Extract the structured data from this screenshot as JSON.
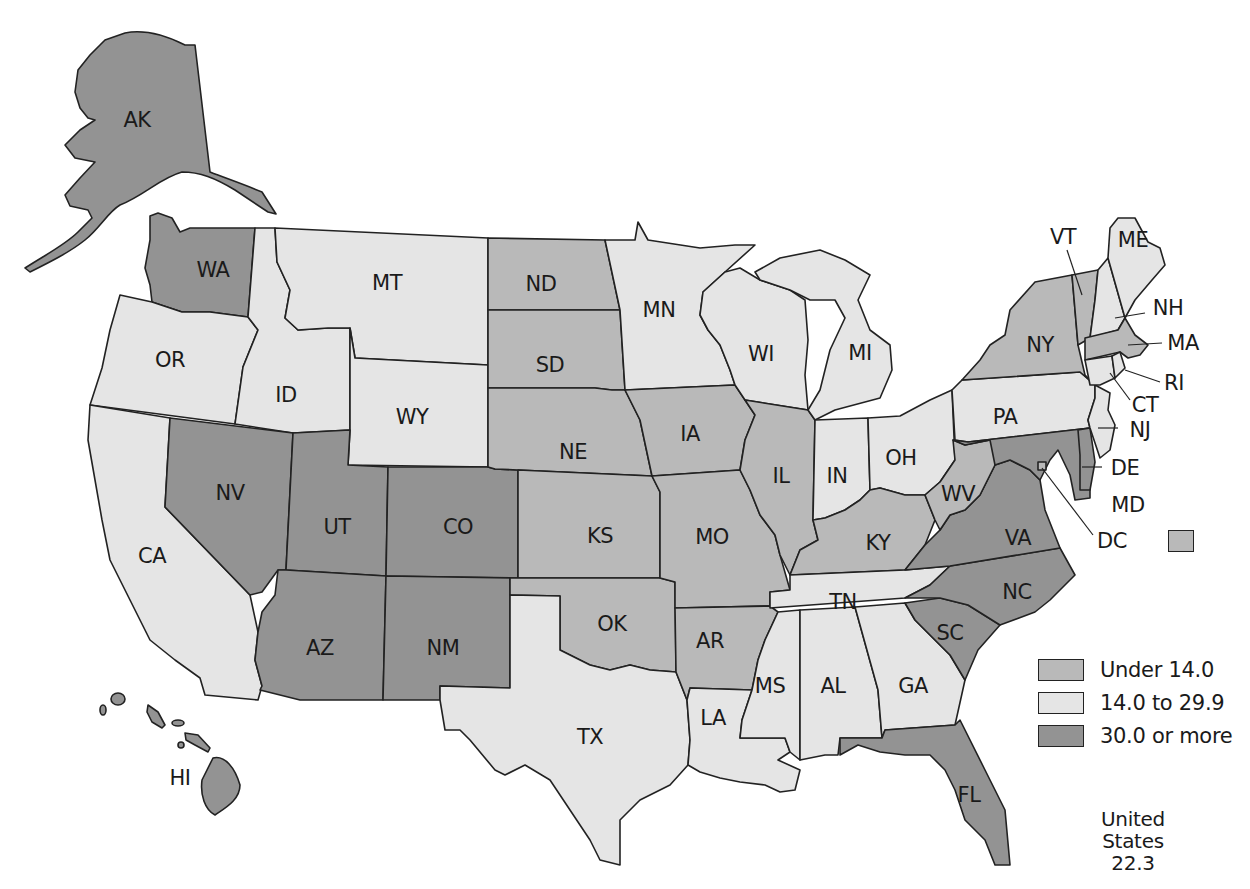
{
  "map": {
    "type": "choropleth",
    "region": "United States",
    "colors": {
      "under_14": "#b9b9b9",
      "14_to_29_9": "#e5e5e5",
      "30_or_more": "#939393"
    },
    "legend": [
      {
        "label": "Under 14.0",
        "class": "under_14"
      },
      {
        "label": "14.0 to 29.9",
        "class": "14_to_29_9"
      },
      {
        "label": "30.0 or more",
        "class": "30_or_more"
      }
    ],
    "us_total": {
      "label": "United States",
      "value": "22.3"
    },
    "states": {
      "AK": "30_or_more",
      "HI": "30_or_more",
      "WA": "30_or_more",
      "OR": "14_to_29_9",
      "CA": "14_to_29_9",
      "ID": "14_to_29_9",
      "NV": "30_or_more",
      "MT": "14_to_29_9",
      "WY": "14_to_29_9",
      "UT": "30_or_more",
      "CO": "30_or_more",
      "AZ": "30_or_more",
      "NM": "30_or_more",
      "ND": "under_14",
      "SD": "under_14",
      "NE": "under_14",
      "KS": "under_14",
      "OK": "under_14",
      "TX": "14_to_29_9",
      "MN": "14_to_29_9",
      "IA": "under_14",
      "MO": "under_14",
      "AR": "under_14",
      "LA": "14_to_29_9",
      "WI": "14_to_29_9",
      "IL": "under_14",
      "MI": "14_to_29_9",
      "IN": "14_to_29_9",
      "OH": "14_to_29_9",
      "KY": "under_14",
      "TN": "14_to_29_9",
      "MS": "14_to_29_9",
      "AL": "14_to_29_9",
      "GA": "14_to_29_9",
      "FL": "30_or_more",
      "SC": "30_or_more",
      "NC": "30_or_more",
      "VA": "30_or_more",
      "WV": "under_14",
      "PA": "14_to_29_9",
      "NY": "under_14",
      "VT": "under_14",
      "NH": "14_to_29_9",
      "ME": "14_to_29_9",
      "MA": "under_14",
      "RI": "14_to_29_9",
      "CT": "14_to_29_9",
      "NJ": "14_to_29_9",
      "DE": "30_or_more",
      "MD": "30_or_more",
      "DC": "under_14"
    },
    "labels": {
      "AK": "AK",
      "HI": "HI",
      "WA": "WA",
      "OR": "OR",
      "CA": "CA",
      "ID": "ID",
      "NV": "NV",
      "MT": "MT",
      "WY": "WY",
      "UT": "UT",
      "CO": "CO",
      "AZ": "AZ",
      "NM": "NM",
      "ND": "ND",
      "SD": "SD",
      "NE": "NE",
      "KS": "KS",
      "OK": "OK",
      "TX": "TX",
      "MN": "MN",
      "IA": "IA",
      "MO": "MO",
      "AR": "AR",
      "LA": "LA",
      "WI": "WI",
      "IL": "IL",
      "MI": "MI",
      "IN": "IN",
      "OH": "OH",
      "KY": "KY",
      "TN": "TN",
      "MS": "MS",
      "AL": "AL",
      "GA": "GA",
      "FL": "FL",
      "SC": "SC",
      "NC": "NC",
      "VA": "VA",
      "WV": "WV",
      "PA": "PA",
      "NY": "NY",
      "VT": "VT",
      "NH": "NH",
      "ME": "ME",
      "MA": "MA",
      "RI": "RI",
      "CT": "CT",
      "NJ": "NJ",
      "DE": "DE",
      "MD": "MD",
      "DC": "DC"
    }
  }
}
